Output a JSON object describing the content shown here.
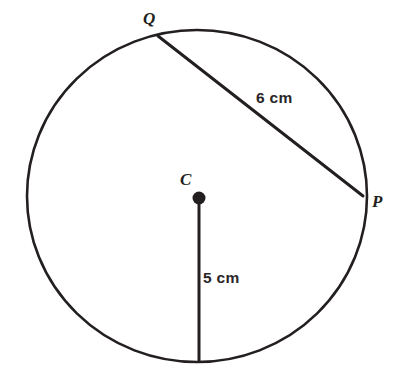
{
  "figure": {
    "background_color": "#ffffff",
    "stroke_color": "#231f20",
    "text_color": "#231f20"
  },
  "labels": {
    "center_point": "C",
    "chord_endpoint_top": "Q",
    "chord_endpoint_right": "P",
    "chord_measure": "6 cm",
    "radius_measure": "5 cm"
  },
  "geometry": {
    "circle": {
      "center_x": 197,
      "center_y": 196,
      "radius_x": 170,
      "radius_y": 166,
      "stroke_width": 2.6
    },
    "center_dot": {
      "x": 199,
      "y": 198,
      "radius": 6.5
    },
    "chord": {
      "x1": 158,
      "y1": 36,
      "x2": 363,
      "y2": 196,
      "stroke_width": 3,
      "length_label": "6 cm"
    },
    "radius_line": {
      "x1": 199,
      "y1": 198,
      "x2": 199,
      "y2": 362,
      "stroke_width": 3,
      "length_label": "5 cm"
    }
  }
}
